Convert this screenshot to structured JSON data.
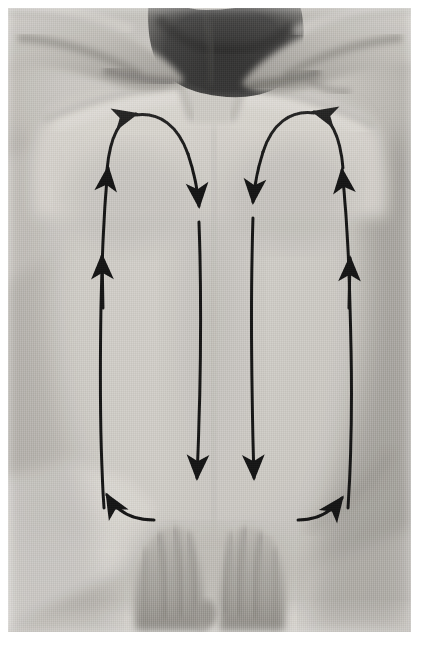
{
  "figure": {
    "kind": "photograph",
    "medium": "black-and-white instructional photograph",
    "overlay": "hand-drawn directional stroke arrows",
    "border_color": "#ffffff",
    "photo_rect": {
      "x": 8,
      "y": 8,
      "width": 403,
      "height": 624
    }
  },
  "palette": {
    "arrow": "#0d0d0d",
    "skin_light": "#d7d4cf",
    "skin_mid": "#bcb9b4",
    "skin_shadow": "#9a968f",
    "skin_deep_shadow": "#7d7a74",
    "hair_dark": "#141414",
    "sheet_white": "#ececec",
    "background_white": "#ffffff"
  },
  "photo_content": {
    "client": {
      "position": "prone, head at top of frame",
      "hair": "dark, short, at top center",
      "arms": "both arms bent, forearms framing the head",
      "visible_parts": [
        "hair",
        "neck",
        "shoulders",
        "upper back",
        "lower back",
        "forearms",
        "hands"
      ]
    },
    "therapist": {
      "hands": "two hands, fingers pointing upward, thumbs tucked, placed side by side on the lower back",
      "hand_count": 2
    },
    "sheet": {
      "description": "pale draping sheet along the lower edge and left side"
    }
  },
  "chart_data": {
    "type": "diagram",
    "stroke_color": "#0d0d0d",
    "stroke_width_px": 3,
    "paths": [
      {
        "id": "left-loop-up",
        "side": "left",
        "direction": "upward",
        "location": "outer edge of the left side of the back",
        "starts_at": "lower back near the therapist's hands",
        "ends_at": "top of the left shoulder",
        "arrowheads": [
          {
            "at_x": 101,
            "at_y": 228,
            "points": "up"
          },
          {
            "at_x": 133,
            "at_y": 123,
            "points": "up-right"
          }
        ]
      },
      {
        "id": "left-loop-down",
        "side": "left",
        "direction": "downward",
        "location": "left of the spine",
        "starts_at": "top of the left shoulder",
        "ends_at": "lower back beside the therapist's hands",
        "arrowheads": [
          {
            "at_x": 199,
            "at_y": 216,
            "points": "down"
          },
          {
            "at_x": 196,
            "at_y": 508,
            "points": "down"
          }
        ]
      },
      {
        "id": "right-loop-down",
        "side": "right",
        "direction": "downward",
        "location": "right of the spine",
        "starts_at": "top of the right shoulder",
        "ends_at": "lower back beside the therapist's hands",
        "arrowheads": [
          {
            "at_x": 253,
            "at_y": 210,
            "points": "down"
          },
          {
            "at_x": 250,
            "at_y": 508,
            "points": "down"
          }
        ]
      },
      {
        "id": "right-loop-up",
        "side": "right",
        "direction": "upward",
        "location": "outer edge of the right side of the back",
        "starts_at": "lower back near the therapist's hands",
        "ends_at": "top of the right shoulder",
        "arrowheads": [
          {
            "at_x": 340,
            "at_y": 200,
            "points": "up"
          },
          {
            "at_x": 329,
            "at_y": 118,
            "points": "up-left"
          }
        ]
      },
      {
        "id": "left-return-sweep",
        "side": "left",
        "direction": "up-and-left",
        "location": "across the lower back toward the left side",
        "starts_at": "beside the therapist's left hand",
        "ends_at": "outer lower left back",
        "arrowheads": [
          {
            "at_x": 96,
            "at_y": 492,
            "points": "up-left"
          }
        ]
      },
      {
        "id": "right-return-sweep",
        "side": "right",
        "direction": "up-and-right",
        "location": "across the lower back toward the right side",
        "starts_at": "beside the therapist's right hand",
        "ends_at": "outer lower right back",
        "arrowheads": [
          {
            "at_x": 313,
            "at_y": 496,
            "points": "up-right"
          }
        ]
      }
    ],
    "arrowhead_count": 10,
    "loop_count": 2
  }
}
